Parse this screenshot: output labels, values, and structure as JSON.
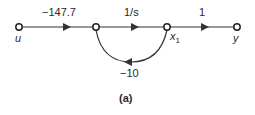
{
  "diagram": {
    "type": "signal-flow-graph",
    "caption": "(a)",
    "nodes": [
      {
        "id": "u",
        "label": "u",
        "x": 19,
        "y": 27
      },
      {
        "id": "n1",
        "label": "",
        "x": 96,
        "y": 27
      },
      {
        "id": "x1",
        "label": "x",
        "subscript": "1",
        "x": 167,
        "y": 27
      },
      {
        "id": "y",
        "label": "y",
        "x": 237,
        "y": 27
      }
    ],
    "edges": [
      {
        "from": "u",
        "to": "n1",
        "gain": "−147.7"
      },
      {
        "from": "n1",
        "to": "x1",
        "gain": "1/s"
      },
      {
        "from": "x1",
        "to": "y",
        "gain": "1"
      },
      {
        "from": "x1",
        "to": "n1",
        "gain": "−10",
        "style": "feedback-arc"
      }
    ],
    "colors": {
      "line": "#333333",
      "background": "#ffffff"
    }
  }
}
